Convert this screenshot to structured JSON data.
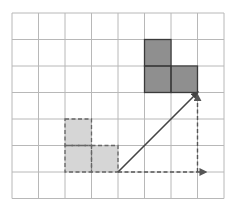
{
  "diagram": {
    "title": "",
    "grid": {
      "columns": 8,
      "rows": 7,
      "origin_x": 12,
      "origin_y": 13,
      "cell_size": 26.5,
      "line_color": "#b8b8b8",
      "border_color": "#a8a8a8"
    },
    "shapes": [
      {
        "name": "original-l-shape",
        "fill": "#d6d6d6",
        "stroke": "#666666",
        "stroke_style": "dashed",
        "cells": [
          [
            2,
            4
          ],
          [
            2,
            5
          ],
          [
            3,
            5
          ]
        ]
      },
      {
        "name": "translated-l-shape",
        "fill": "#8f8f8f",
        "stroke": "#3a3a3a",
        "stroke_style": "solid",
        "cells": [
          [
            5,
            1
          ],
          [
            5,
            2
          ],
          [
            6,
            2
          ]
        ]
      }
    ],
    "vectors": [
      {
        "name": "translation-vector",
        "from": [
          4,
          6
        ],
        "to": [
          7,
          3
        ],
        "style": "solid",
        "color": "#444444"
      },
      {
        "name": "horizontal-component",
        "from": [
          4,
          6
        ],
        "to": [
          7.3,
          6
        ],
        "style": "dashed",
        "color": "#555555"
      },
      {
        "name": "vertical-component",
        "from": [
          7,
          6
        ],
        "to": [
          7,
          3.1
        ],
        "style": "dashed",
        "color": "#555555"
      }
    ]
  }
}
